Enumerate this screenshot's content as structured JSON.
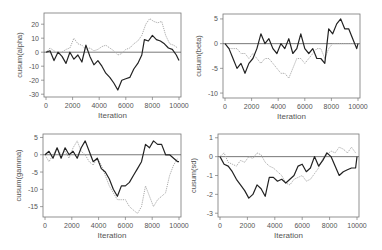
{
  "chart_data": [
    {
      "type": "line",
      "title": "",
      "xlabel": "Iteration",
      "ylabel": "cusum(alpha)",
      "xlim": [
        0,
        10000
      ],
      "ylim": [
        -32,
        28
      ],
      "xticks": [
        0,
        2000,
        4000,
        6000,
        8000,
        10000
      ],
      "xtick_labels": [
        "0",
        "2000",
        "4000",
        "6000",
        "8000",
        "10000"
      ],
      "yticks": [
        -30,
        -20,
        -10,
        0,
        10,
        20
      ],
      "ytick_labels": [
        "-30",
        "-20",
        "-10",
        "0",
        "10",
        "20"
      ],
      "hline": 0,
      "grid": false,
      "series": [
        {
          "name": "chain 1",
          "color": "#222222",
          "style": "solid",
          "x": [
            0,
            300,
            600,
            900,
            1200,
            1500,
            1800,
            2100,
            2400,
            2700,
            3000,
            3300,
            3600,
            3900,
            4200,
            4500,
            4800,
            5100,
            5400,
            5700,
            6000,
            6300,
            6600,
            6900,
            7200,
            7400,
            7700,
            8000,
            8300,
            8600,
            8900,
            9200,
            9500,
            9800,
            10000
          ],
          "y": [
            0,
            1,
            -6,
            0,
            -3,
            -8,
            0,
            -5,
            -2,
            -7,
            5,
            -3,
            -9,
            -6,
            -10,
            -15,
            -18,
            -22,
            -27,
            -20,
            -19,
            -18,
            -12,
            -8,
            -2,
            9,
            8,
            12,
            9,
            8,
            6,
            3,
            2,
            -2,
            -6
          ]
        },
        {
          "name": "chain 2",
          "color": "#aaaaaa",
          "style": "dotted",
          "x": [
            0,
            300,
            600,
            900,
            1200,
            1500,
            1800,
            2100,
            2400,
            2700,
            3000,
            3300,
            3600,
            3900,
            4200,
            4500,
            4800,
            5100,
            5400,
            5700,
            6000,
            6300,
            6600,
            6900,
            7200,
            7500,
            7800,
            8100,
            8400,
            8700,
            9000,
            9300,
            9600,
            9900
          ],
          "y": [
            0,
            3,
            1,
            -1,
            0,
            2,
            3,
            10,
            6,
            5,
            2,
            3,
            1,
            2,
            4,
            5,
            3,
            1,
            -2,
            -1,
            2,
            3,
            6,
            8,
            12,
            20,
            24,
            22,
            21,
            22,
            12,
            6,
            5,
            3
          ]
        }
      ]
    },
    {
      "type": "line",
      "title": "",
      "xlabel": "Iteration",
      "ylabel": "cusum(beta)",
      "xlim": [
        0,
        10000
      ],
      "ylim": [
        -11,
        6
      ],
      "xticks": [
        0,
        2000,
        4000,
        6000,
        8000,
        10000
      ],
      "xtick_labels": [
        "0",
        "2000",
        "4000",
        "6000",
        "8000",
        "10000"
      ],
      "yticks": [
        -10,
        -5,
        0,
        5
      ],
      "ytick_labels": [
        "-10",
        "-5",
        "0",
        "5"
      ],
      "hline": 0,
      "grid": false,
      "series": [
        {
          "name": "chain 1",
          "color": "#222222",
          "style": "solid",
          "x": [
            0,
            300,
            600,
            900,
            1200,
            1500,
            1800,
            2100,
            2400,
            2700,
            3000,
            3300,
            3600,
            3900,
            4200,
            4500,
            4800,
            5100,
            5400,
            5700,
            6000,
            6300,
            6600,
            6900,
            7200,
            7500,
            7800,
            8100,
            8400,
            8700,
            9000,
            9300,
            9600,
            9900,
            10000
          ],
          "y": [
            0,
            -1,
            -3,
            -5,
            -4,
            -6,
            -4,
            -3,
            -1,
            2,
            0,
            1,
            -1,
            -2,
            0,
            -1,
            1,
            -2,
            -1,
            2,
            -1,
            -2,
            -1,
            -3,
            -3,
            -4,
            3,
            2,
            4,
            5,
            3,
            3,
            1,
            -1,
            0
          ]
        },
        {
          "name": "chain 2",
          "color": "#aaaaaa",
          "style": "dotted",
          "x": [
            0,
            300,
            600,
            900,
            1200,
            1500,
            1800,
            2100,
            2400,
            2700,
            3000,
            3300,
            3600,
            3900,
            4200,
            4500,
            4800,
            5100,
            5400,
            5700,
            6000,
            6300,
            6600,
            6900,
            7200,
            7500,
            7800,
            8100,
            8400,
            8700,
            9000,
            9300,
            9600,
            9900
          ],
          "y": [
            0,
            -1,
            -1,
            -1,
            -2,
            -2,
            -3,
            -2,
            -3,
            -4,
            -3,
            -3,
            -4,
            -5,
            -6,
            -6,
            -7,
            -5,
            -3,
            -3,
            -4,
            -3,
            -2,
            -1,
            -1,
            -3,
            -1,
            0,
            0,
            0,
            0,
            0,
            0,
            0
          ]
        }
      ]
    },
    {
      "type": "line",
      "title": "",
      "xlabel": "Iteration",
      "ylabel": "cusum(gamma)",
      "xlim": [
        0,
        10000
      ],
      "ylim": [
        -18,
        6
      ],
      "xticks": [
        0,
        2000,
        4000,
        6000,
        8000,
        10000
      ],
      "xtick_labels": [
        "0",
        "2000",
        "4000",
        "6000",
        "8000",
        "10000"
      ],
      "yticks": [
        -15,
        -10,
        -5,
        0,
        5
      ],
      "ytick_labels": [
        "-15",
        "-10",
        "-5",
        "0",
        "5"
      ],
      "hline": 0,
      "grid": false,
      "series": [
        {
          "name": "chain 1",
          "color": "#222222",
          "style": "solid",
          "x": [
            0,
            300,
            600,
            900,
            1200,
            1500,
            1800,
            2100,
            2400,
            2700,
            3000,
            3300,
            3600,
            3900,
            4200,
            4500,
            4800,
            5100,
            5400,
            5700,
            6000,
            6300,
            6600,
            6900,
            7200,
            7500,
            7800,
            8100,
            8400,
            8700,
            9000,
            9300,
            9600,
            9900,
            10000
          ],
          "y": [
            0,
            1,
            -1,
            2,
            -1,
            2,
            0,
            1,
            -1,
            2,
            4,
            1,
            -2,
            -1,
            -4,
            -5,
            -7,
            -10,
            -12,
            -9,
            -9,
            -8,
            -6,
            -4,
            -2,
            3,
            2,
            4,
            3,
            3,
            0,
            0,
            -1,
            -2,
            -2
          ]
        },
        {
          "name": "chain 2",
          "color": "#aaaaaa",
          "style": "dotted",
          "x": [
            0,
            300,
            600,
            900,
            1200,
            1500,
            1800,
            2100,
            2400,
            2700,
            3000,
            3300,
            3600,
            3900,
            4200,
            4500,
            4800,
            5100,
            5400,
            5700,
            6000,
            6300,
            6600,
            6900,
            7200,
            7500,
            7800,
            8100,
            8400,
            8700,
            9000,
            9300,
            9600,
            9900
          ],
          "y": [
            0,
            -2,
            0,
            2,
            0,
            1,
            -1,
            2,
            4,
            1,
            0,
            -2,
            -3,
            -1,
            -3,
            -6,
            -9,
            -11,
            -13,
            -13,
            -13,
            -15,
            -16,
            -17,
            -15,
            -9,
            -12,
            -15,
            -13,
            -12,
            -11,
            -6,
            -3,
            -1
          ]
        }
      ]
    },
    {
      "type": "line",
      "title": "",
      "xlabel": "Iteration",
      "ylabel": "cusum(sd)",
      "xlim": [
        0,
        10000
      ],
      "ylim": [
        -3.2,
        1.2
      ],
      "xticks": [
        0,
        2000,
        4000,
        6000,
        8000,
        10000
      ],
      "xtick_labels": [
        "0",
        "2000",
        "4000",
        "6000",
        "8000",
        "10000"
      ],
      "yticks": [
        -3,
        -2,
        -1,
        0,
        1
      ],
      "ytick_labels": [
        "-3",
        "-2",
        "-1",
        "0",
        "1"
      ],
      "hline": 0,
      "grid": false,
      "series": [
        {
          "name": "chain 1",
          "color": "#222222",
          "style": "solid",
          "x": [
            0,
            300,
            600,
            900,
            1200,
            1500,
            1800,
            2100,
            2400,
            2700,
            3000,
            3300,
            3600,
            3900,
            4200,
            4500,
            4800,
            5100,
            5400,
            5700,
            6000,
            6300,
            6600,
            6900,
            7200,
            7500,
            7800,
            8100,
            8400,
            8700,
            9000,
            9300,
            9600,
            9900,
            10000
          ],
          "y": [
            0,
            -0.4,
            -0.5,
            -0.8,
            -1.2,
            -1.5,
            -1.8,
            -2.2,
            -2.0,
            -1.5,
            -1.7,
            -2.1,
            -1.1,
            -1.1,
            -1.3,
            -1.2,
            -1.4,
            -1.2,
            -1.0,
            -0.5,
            -0.4,
            -0.8,
            -0.6,
            0.0,
            -0.5,
            -0.2,
            0.2,
            0.0,
            -0.5,
            -1.0,
            -0.8,
            -0.7,
            -0.6,
            -0.6,
            0.0
          ]
        },
        {
          "name": "chain 2",
          "color": "#aaaaaa",
          "style": "dotted",
          "x": [
            0,
            300,
            600,
            900,
            1200,
            1500,
            1800,
            2100,
            2400,
            2700,
            3000,
            3300,
            3600,
            3900,
            4200,
            4500,
            4800,
            5100,
            5400,
            5700,
            6000,
            6300,
            6600,
            6900,
            7200,
            7500,
            7800,
            8100,
            8400,
            8700,
            9000,
            9300,
            9600,
            9900
          ],
          "y": [
            0,
            0.2,
            -0.3,
            -0.4,
            -0.5,
            -0.2,
            -0.3,
            0.0,
            -0.1,
            0.2,
            0.1,
            -0.3,
            -0.5,
            -0.6,
            -0.8,
            -1.0,
            -1.4,
            -1.5,
            -1.2,
            -1.1,
            -1.0,
            -1.3,
            -1.2,
            -0.9,
            -0.6,
            -0.1,
            0.1,
            0.3,
            0.2,
            0.5,
            0.4,
            0.2,
            0.5,
            0.2
          ]
        }
      ]
    }
  ]
}
